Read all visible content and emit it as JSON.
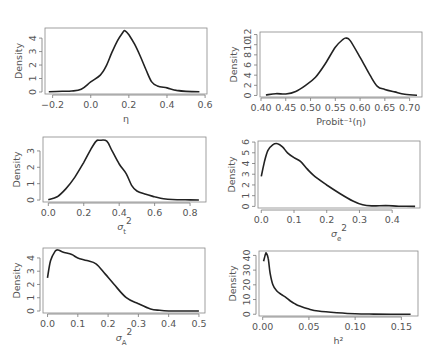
{
  "page_marker": "",
  "chart_data": [
    {
      "type": "line",
      "title": "",
      "xlabel": "η",
      "ylabel": "Density",
      "xlim": [
        -0.24,
        0.61
      ],
      "ylim": [
        -0.15,
        4.75
      ],
      "xticks": [
        -0.2,
        0.0,
        0.2,
        0.4,
        0.6
      ],
      "xtick_labels": [
        "−0.2",
        "0.0",
        "0.2",
        "0.4",
        "0.6"
      ],
      "yticks": [
        0,
        1,
        2,
        3,
        4
      ],
      "ytick_labels": [
        "0",
        "1",
        "2",
        "3",
        "4"
      ],
      "grid": false,
      "box": {
        "x0": 45,
        "x1": 207,
        "y0": 28,
        "y1": 94
      },
      "axis_pos": {
        "xaxis_y": 95,
        "yaxis_x": 42
      },
      "x": [
        -0.22,
        -0.15,
        -0.1,
        -0.05,
        0.0,
        0.05,
        0.08,
        0.11,
        0.14,
        0.17,
        0.18,
        0.2,
        0.23,
        0.26,
        0.29,
        0.32,
        0.35,
        0.4,
        0.45,
        0.5,
        0.57
      ],
      "y": [
        0.02,
        0.05,
        0.07,
        0.2,
        0.75,
        1.25,
        1.9,
        2.9,
        3.8,
        4.45,
        4.55,
        4.25,
        3.55,
        2.65,
        1.65,
        0.75,
        0.45,
        0.3,
        0.12,
        0.04,
        0.01
      ]
    },
    {
      "type": "line",
      "title": "",
      "xlabel": "Probit⁻¹(η)",
      "ylabel": "Density",
      "xlim": [
        0.398,
        0.725
      ],
      "ylim": [
        -0.3,
        12.5
      ],
      "xticks": [
        0.4,
        0.45,
        0.5,
        0.55,
        0.6,
        0.65,
        0.7
      ],
      "xtick_labels": [
        "0.40",
        "0.45",
        "0.50",
        "0.55",
        "0.60",
        "0.65",
        "0.70"
      ],
      "yticks": [
        0,
        2,
        4,
        6,
        8,
        10,
        12
      ],
      "ytick_labels": [
        "0",
        "2",
        "4",
        "6",
        "8",
        "10",
        "12"
      ],
      "grid": false,
      "box": {
        "x0": 260,
        "x1": 422,
        "y0": 32,
        "y1": 97
      },
      "axis_pos": {
        "xaxis_y": 98,
        "yaxis_x": 257
      },
      "x": [
        0.41,
        0.43,
        0.45,
        0.47,
        0.49,
        0.51,
        0.53,
        0.55,
        0.565,
        0.572,
        0.58,
        0.6,
        0.62,
        0.635,
        0.65,
        0.67,
        0.69,
        0.715
      ],
      "y": [
        0.1,
        0.35,
        0.3,
        0.8,
        2.0,
        3.6,
        6.3,
        9.5,
        11.0,
        11.3,
        10.8,
        7.5,
        4.0,
        1.8,
        1.2,
        0.7,
        0.25,
        0.05
      ]
    },
    {
      "type": "line",
      "title": "",
      "xlabel": "σ_t²",
      "ylabel": "Density",
      "xlim": [
        -0.03,
        0.89
      ],
      "ylim": [
        -0.12,
        3.85
      ],
      "xticks": [
        0.0,
        0.2,
        0.4,
        0.6,
        0.8
      ],
      "xtick_labels": [
        "0.0",
        "0.2",
        "0.4",
        "0.6",
        "0.8"
      ],
      "yticks": [
        0,
        1,
        2,
        3
      ],
      "ytick_labels": [
        "0",
        "1",
        "2",
        "3"
      ],
      "grid": false,
      "box": {
        "x0": 43,
        "x1": 206,
        "y0": 137,
        "y1": 202
      },
      "axis_pos": {
        "xaxis_y": 203,
        "yaxis_x": 40
      },
      "x": [
        0.0,
        0.05,
        0.1,
        0.15,
        0.2,
        0.24,
        0.27,
        0.29,
        0.33,
        0.36,
        0.4,
        0.44,
        0.47,
        0.5,
        0.55,
        0.6,
        0.65,
        0.7,
        0.8,
        0.85
      ],
      "y": [
        0.02,
        0.2,
        0.7,
        1.4,
        2.3,
        3.1,
        3.6,
        3.65,
        3.6,
        3.0,
        2.2,
        1.6,
        0.9,
        0.55,
        0.35,
        0.2,
        0.08,
        0.03,
        0.01,
        0.0
      ]
    },
    {
      "type": "line",
      "title": "",
      "xlabel": "σ_e²",
      "ylabel": "Density",
      "xlim": [
        -0.01,
        0.485
      ],
      "ylim": [
        -0.15,
        6.1
      ],
      "xticks": [
        0.0,
        0.1,
        0.2,
        0.3,
        0.4
      ],
      "xtick_labels": [
        "0.0",
        "0.1",
        "0.2",
        "0.3",
        "0.4"
      ],
      "yticks": [
        0,
        1,
        2,
        3,
        4,
        5,
        6
      ],
      "ytick_labels": [
        "0",
        "1",
        "2",
        "3",
        "4",
        "5",
        "6"
      ],
      "grid": false,
      "box": {
        "x0": 258,
        "x1": 420,
        "y0": 141,
        "y1": 208
      },
      "axis_pos": {
        "xaxis_y": 210,
        "yaxis_x": 255
      },
      "x": [
        0.0,
        0.01,
        0.02,
        0.035,
        0.05,
        0.065,
        0.08,
        0.1,
        0.12,
        0.14,
        0.16,
        0.2,
        0.24,
        0.28,
        0.31,
        0.34,
        0.38,
        0.42,
        0.47
      ],
      "y": [
        2.8,
        4.2,
        5.2,
        5.75,
        5.85,
        5.55,
        5.0,
        4.55,
        4.2,
        3.5,
        2.9,
        2.0,
        1.2,
        0.5,
        0.15,
        0.05,
        0.08,
        0.02,
        0.0
      ]
    },
    {
      "type": "line",
      "title": "",
      "xlabel": "σ_A²",
      "ylabel": "Density",
      "xlim": [
        -0.015,
        0.52
      ],
      "ylim": [
        -0.15,
        4.75
      ],
      "xticks": [
        0.0,
        0.1,
        0.2,
        0.3,
        0.4,
        0.5
      ],
      "xtick_labels": [
        "0.0",
        "0.1",
        "0.2",
        "0.3",
        "0.4",
        "0.5"
      ],
      "yticks": [
        0,
        1,
        2,
        3,
        4
      ],
      "ytick_labels": [
        "0",
        "1",
        "2",
        "3",
        "4"
      ],
      "grid": false,
      "box": {
        "x0": 43,
        "x1": 205,
        "y0": 248,
        "y1": 313
      },
      "axis_pos": {
        "xaxis_y": 314,
        "yaxis_x": 40
      },
      "x": [
        0.0,
        0.01,
        0.025,
        0.035,
        0.05,
        0.08,
        0.1,
        0.13,
        0.16,
        0.19,
        0.22,
        0.26,
        0.3,
        0.34,
        0.37,
        0.4,
        0.45,
        0.5
      ],
      "y": [
        2.5,
        3.8,
        4.5,
        4.6,
        4.45,
        4.25,
        4.0,
        3.8,
        3.55,
        2.8,
        2.0,
        1.0,
        0.55,
        0.15,
        0.05,
        0.0,
        0.0,
        0.0
      ]
    },
    {
      "type": "line",
      "title": "",
      "xlabel": "h²",
      "ylabel": "Density",
      "xlim": [
        -0.004,
        0.168
      ],
      "ylim": [
        -1.2,
        43
      ],
      "xticks": [
        0.0,
        0.05,
        0.1,
        0.15
      ],
      "xtick_labels": [
        "0.00",
        "0.05",
        "0.10",
        "0.15"
      ],
      "yticks": [
        0,
        10,
        20,
        30,
        40
      ],
      "ytick_labels": [
        "0",
        "10",
        "20",
        "30",
        "40"
      ],
      "grid": false,
      "box": {
        "x0": 259,
        "x1": 418,
        "y0": 251,
        "y1": 316
      },
      "axis_pos": {
        "xaxis_y": 317,
        "yaxis_x": 256
      },
      "x": [
        0.001,
        0.003,
        0.004,
        0.006,
        0.008,
        0.011,
        0.015,
        0.02,
        0.025,
        0.03,
        0.035,
        0.04,
        0.05,
        0.06,
        0.08,
        0.1,
        0.12,
        0.16
      ],
      "y": [
        36,
        41,
        41.5,
        38,
        28,
        20,
        16,
        13.5,
        11.5,
        9,
        7,
        5.5,
        3.5,
        2.2,
        1.0,
        0.3,
        0.1,
        0.0
      ]
    }
  ]
}
